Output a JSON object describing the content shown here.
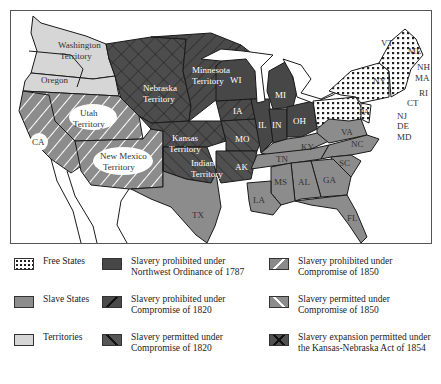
{
  "map": {
    "colors": {
      "free": "#f2f2f2",
      "slave": "#8c8c8c",
      "territory": "#d6d6d6",
      "northwest": "#474747",
      "prohibited_1820": "#4a4a4a",
      "permitted_1820": "#555555",
      "prohibited_1850": "#8a8a8a",
      "permitted_1850": "#8c8c8c",
      "kansas_nebraska": "#505050",
      "water": "#ffffff",
      "border": "#1a1a1a"
    },
    "region_labels": {
      "washington": [
        "Washington",
        "Territory"
      ],
      "oregon": "Oregon",
      "nebraska": [
        "Nebraska",
        "Territory"
      ],
      "minnesota": [
        "Minnesota",
        "Territory"
      ],
      "utah": [
        "Utah",
        "Territory"
      ],
      "new_mexico": [
        "New Mexico",
        "Territory"
      ],
      "kansas": [
        "Kansas",
        "Territory"
      ],
      "indian": [
        "Indian",
        "Territory"
      ],
      "ca": "CA",
      "tx": "TX",
      "wi": "WI",
      "mi": "MI",
      "ia": "IA",
      "il": "IL",
      "in": "IN",
      "oh": "OH",
      "mo": "MO",
      "ak": "AK",
      "ky": "KY",
      "tn": "TN",
      "va": "VA",
      "nc": "NC",
      "sc": "SC",
      "ga": "GA",
      "al": "AL",
      "ms": "MS",
      "la": "LA",
      "fl": "FL",
      "pa": "PA",
      "ny": "NY",
      "vt": "VT",
      "me": "ME",
      "nh": "NH",
      "ma": "MA",
      "ri": "RI",
      "ct": "CT",
      "nj": "NJ",
      "de": "DE",
      "md": "MD"
    }
  },
  "legend": {
    "items": [
      {
        "key": "free",
        "label": "Free States"
      },
      {
        "key": "northwest",
        "label": "Slavery prohibited under Northwest Ordinance of 1787"
      },
      {
        "key": "prohibited_1850",
        "label": "Slavery prohibited under Compromise of 1850"
      },
      {
        "key": "slave",
        "label": "Slave States"
      },
      {
        "key": "prohibited_1820",
        "label": "Slavery prohibited under Compromise of 1820"
      },
      {
        "key": "permitted_1850",
        "label": "Slavery permitted under Compromise of 1850"
      },
      {
        "key": "territory",
        "label": "Territories"
      },
      {
        "key": "permitted_1820",
        "label": "Slavery permitted under Compromise of 1820"
      },
      {
        "key": "kansas_nebraska",
        "label": "Slavery expansion permitted under the Kansas-Nebraska Act of 1854"
      }
    ]
  }
}
